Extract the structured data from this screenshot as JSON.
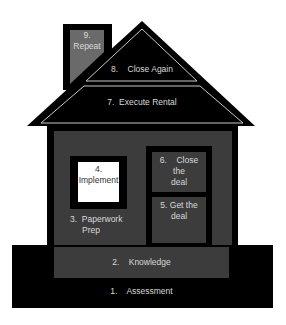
{
  "diagram": {
    "type": "house-process-diagram",
    "colors": {
      "background": "#ffffff",
      "structure": "#000000",
      "panel_gray": "#3c3c3c",
      "chimney_gray": "#6a6a6a",
      "window_white": "#ffffff",
      "outline_light": "#c8c8c8",
      "text_light": "#d9d9d9",
      "text_dark": "#333333"
    },
    "steps": [
      {
        "number": "1.",
        "label": "Assessment",
        "text": "1.    Assessment",
        "location": "foundation"
      },
      {
        "number": "2.",
        "label": "Knowledge",
        "text": "2.    Knowledge",
        "location": "floor"
      },
      {
        "number": "3.",
        "label": "Paperwork Prep",
        "line1": "3.  Paperwork",
        "line2": "Prep",
        "location": "wall"
      },
      {
        "number": "4.",
        "label": "Implement",
        "line1": "4.",
        "line2": "Implement",
        "location": "window"
      },
      {
        "number": "5.",
        "label": "Get the deal",
        "line1": "5. Get the",
        "line2": "deal",
        "location": "door-lower"
      },
      {
        "number": "6.",
        "label": "Close the deal",
        "line1": "6.    Close",
        "line2": "the",
        "line3": "deal",
        "location": "door-upper"
      },
      {
        "number": "7.",
        "label": "Execute Rental",
        "text": "7.  Execute Rental",
        "location": "roof-lower"
      },
      {
        "number": "8.",
        "label": "Close Again",
        "text": "8.    Close Again",
        "location": "roof-upper"
      },
      {
        "number": "9.",
        "label": "Repeat",
        "line1": "9.",
        "line2": "Repeat",
        "location": "chimney"
      }
    ]
  }
}
